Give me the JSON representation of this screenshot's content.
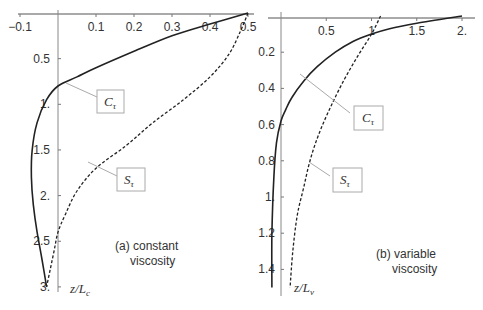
{
  "chart_data": [
    {
      "type": "line",
      "panel": "a",
      "annotation_line1": "(a) constant",
      "annotation_line2": "viscosity",
      "ylabel": "z/L_c",
      "ylabel_main": "z/L",
      "ylabel_sub": "c",
      "xlim": [
        -0.1,
        0.5
      ],
      "ylim": [
        0,
        3
      ],
      "y_inverted": true,
      "x_ticks": [
        "-0.1",
        "0.1",
        "0.2",
        "0.3",
        "0.4",
        "0.5"
      ],
      "y_ticks": [
        "0.5",
        "1.",
        "1.5",
        "2.",
        "2.5",
        "3."
      ],
      "series": [
        {
          "name": "C_τ",
          "label_main": "C",
          "label_sub": "τ",
          "style": "solid",
          "x": [
            0.5,
            0.4,
            0.3,
            0.2,
            0.1,
            0.05,
            0.0,
            -0.03,
            -0.055,
            -0.068,
            -0.07,
            -0.065,
            -0.055,
            -0.042,
            -0.03
          ],
          "z": [
            0.0,
            0.12,
            0.25,
            0.42,
            0.6,
            0.7,
            0.8,
            0.95,
            1.2,
            1.5,
            1.8,
            2.1,
            2.4,
            2.7,
            3.0
          ]
        },
        {
          "name": "S_τ",
          "label_main": "S",
          "label_sub": "τ",
          "style": "dashed",
          "x": [
            0.5,
            0.48,
            0.45,
            0.4,
            0.33,
            0.25,
            0.18,
            0.1,
            0.05,
            0.02,
            0.0,
            -0.01,
            -0.02,
            -0.03
          ],
          "z": [
            0.0,
            0.2,
            0.45,
            0.7,
            0.95,
            1.2,
            1.45,
            1.7,
            1.95,
            2.2,
            2.4,
            2.6,
            2.8,
            3.0
          ]
        }
      ]
    },
    {
      "type": "line",
      "panel": "b",
      "annotation_line1": "(b) variable",
      "annotation_line2": "viscosity",
      "ylabel": "z/L_v",
      "ylabel_main": "z/L",
      "ylabel_sub": "v",
      "xlim": [
        0,
        2.0
      ],
      "ylim": [
        0,
        1.5
      ],
      "y_inverted": true,
      "x_ticks": [
        "0.5",
        "1",
        "1.5",
        "2."
      ],
      "y_ticks": [
        "0.2",
        "0.4",
        "0.6",
        "0.8",
        "1.",
        "1.2",
        "1.4"
      ],
      "series": [
        {
          "name": "C_τ",
          "label_main": "C",
          "label_sub": "τ",
          "style": "solid",
          "x": [
            2.0,
            1.5,
            1.2,
            1.0,
            0.8,
            0.6,
            0.4,
            0.25,
            0.12,
            0.05,
            0.0,
            -0.05,
            -0.08,
            -0.1,
            -0.1
          ],
          "z": [
            0.0,
            0.04,
            0.07,
            0.1,
            0.14,
            0.2,
            0.28,
            0.36,
            0.45,
            0.52,
            0.58,
            0.7,
            0.9,
            1.2,
            1.5
          ]
        },
        {
          "name": "S_τ",
          "label_main": "S",
          "label_sub": "τ",
          "style": "dashed",
          "x": [
            1.1,
            1.0,
            0.85,
            0.7,
            0.55,
            0.42,
            0.32,
            0.25,
            0.18,
            0.13,
            0.1
          ],
          "z": [
            0.0,
            0.1,
            0.22,
            0.35,
            0.5,
            0.65,
            0.8,
            0.95,
            1.1,
            1.3,
            1.5
          ]
        }
      ]
    }
  ]
}
